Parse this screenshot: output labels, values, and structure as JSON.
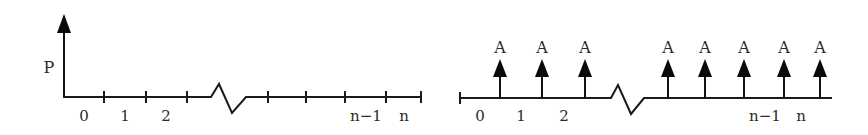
{
  "left_diagram": {
    "title": "Single present value",
    "vertical_label": "P",
    "period_labels": [
      "0",
      "1",
      "2",
      "n−1",
      "n"
    ]
  },
  "right_diagram": {
    "title": "Uniform series",
    "payment_label": "A",
    "payment_labels": [
      "A",
      "A",
      "A",
      "A",
      "A",
      "A",
      "A",
      "A"
    ],
    "period_labels": [
      "0",
      "1",
      "2",
      "n−1",
      "n"
    ]
  },
  "colors": {
    "line": "#1a1a1a",
    "text": "#2a2a2a",
    "background": "#ffffff"
  }
}
